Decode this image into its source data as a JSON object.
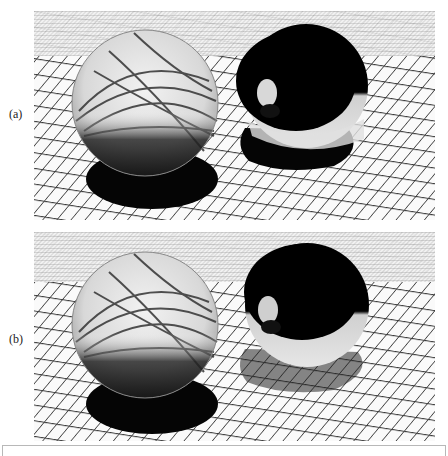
{
  "figure": {
    "panels": [
      {
        "label": "(a)",
        "description": "Rendered scene: glass sphere (left) and mirror sphere (right) on a dark-line grid floor; opaque black shadows"
      },
      {
        "label": "(b)",
        "description": "Rendered scene: glass sphere (left) and mirror sphere (right) on a dark-line grid floor; noisy caustics, mirror sphere shadow is semi-transparent gray"
      }
    ]
  }
}
